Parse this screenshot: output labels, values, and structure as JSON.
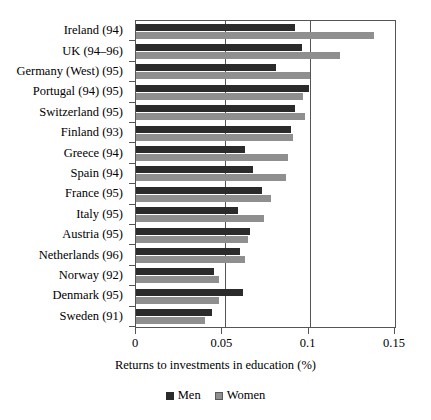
{
  "chart_data": {
    "type": "bar",
    "orientation": "horizontal",
    "title": "",
    "xlabel": "Returns to investments in education (%)",
    "ylabel": "",
    "xlim": [
      0,
      0.15
    ],
    "xticks": [
      "0",
      "0.05",
      "0.1",
      "0.15"
    ],
    "xtick_values": [
      0,
      0.05,
      0.1,
      0.15
    ],
    "grid": true,
    "legend_position": "bottom",
    "categories": [
      "Ireland (94)",
      "UK (94–96)",
      "Germany (West) (95)",
      "Portugal (94) (95)",
      "Switzerland (95)",
      "Finland (93)",
      "Greece (94)",
      "Spain (94)",
      "France (95)",
      "Italy (95)",
      "Austria (95)",
      "Netherlands (96)",
      "Norway (92)",
      "Denmark (95)",
      "Sweden (91)"
    ],
    "series": [
      {
        "name": "Men",
        "color": "#2b2b2b",
        "values": [
          0.092,
          0.096,
          0.081,
          0.1,
          0.092,
          0.09,
          0.063,
          0.068,
          0.073,
          0.059,
          0.066,
          0.06,
          0.045,
          0.062,
          0.044
        ]
      },
      {
        "name": "Women",
        "color": "#8f8f8f",
        "values": [
          0.138,
          0.118,
          0.101,
          0.097,
          0.098,
          0.091,
          0.088,
          0.087,
          0.078,
          0.074,
          0.065,
          0.063,
          0.048,
          0.048,
          0.04
        ]
      }
    ]
  },
  "legend": {
    "items": [
      {
        "label": "Men",
        "marker": "square-filled-dark"
      },
      {
        "label": "Women",
        "marker": "square-filled-gray"
      }
    ]
  }
}
